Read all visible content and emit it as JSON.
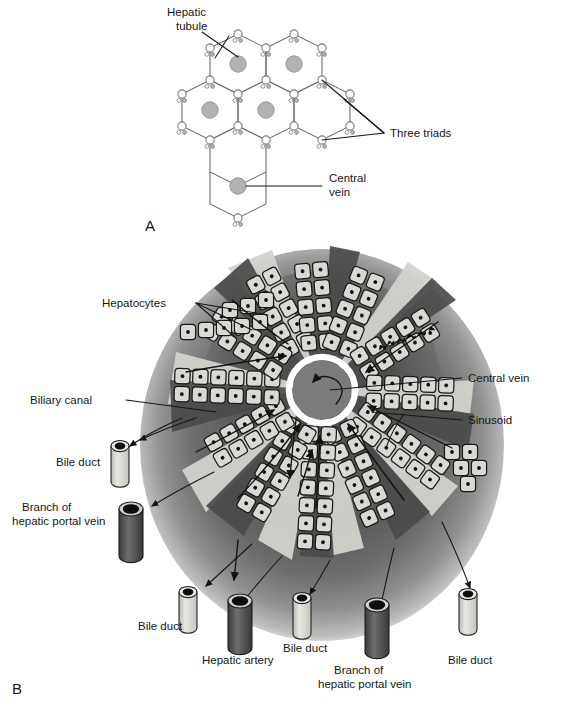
{
  "figure": {
    "panels": [
      {
        "id": "A",
        "letter": "A",
        "description": "Hexagonal arrangement of hepatic lobules showing triads and central veins",
        "labels": [
          {
            "key": "hepatic_tubule",
            "text_line1": "Hepatic",
            "text_line2": "tubule"
          },
          {
            "key": "three_triads",
            "text_line1": "Three triads",
            "text_line2": ""
          },
          {
            "key": "central_vein",
            "text_line1": "Central",
            "text_line2": "vein"
          }
        ],
        "counts": {
          "central_veins": 5,
          "triad_groups": 14,
          "triad_components_per_group": 3
        }
      },
      {
        "id": "B",
        "letter": "B",
        "description": "Cut-away of a single liver lobule with radiating plates of hepatocytes draining to the central vein",
        "signature": "Brand Christensen",
        "labels": [
          {
            "key": "hepatocytes",
            "text_line1": "Hepatocytes",
            "text_line2": ""
          },
          {
            "key": "biliary_canal",
            "text_line1": "Biliary canal",
            "text_line2": ""
          },
          {
            "key": "bile_duct_left_upper",
            "text_line1": "Bile duct",
            "text_line2": ""
          },
          {
            "key": "branch_hepatic_portal_vein_left",
            "text_line1": "Branch of",
            "text_line2": "hepatic portal vein"
          },
          {
            "key": "bile_duct_bottom_1",
            "text_line1": "Bile duct",
            "text_line2": ""
          },
          {
            "key": "hepatic_artery",
            "text_line1": "Hepatic artery",
            "text_line2": ""
          },
          {
            "key": "bile_duct_bottom_2",
            "text_line1": "Bile duct",
            "text_line2": ""
          },
          {
            "key": "branch_hepatic_portal_vein_bottom",
            "text_line1": "Branch of",
            "text_line2": "hepatic portal vein"
          },
          {
            "key": "bile_duct_bottom_3",
            "text_line1": "Bile duct",
            "text_line2": ""
          },
          {
            "key": "central_vein",
            "text_line1": "Central vein",
            "text_line2": ""
          },
          {
            "key": "sinusoid",
            "text_line1": "Sinusoid",
            "text_line2": ""
          }
        ],
        "vessels": [
          {
            "key": "bile_duct_left_upper",
            "type": "bile-duct",
            "tone": "light"
          },
          {
            "key": "branch_hepatic_portal_vein_left",
            "type": "portal-vein-branch",
            "tone": "dark"
          },
          {
            "key": "bile_duct_bottom_1",
            "type": "bile-duct",
            "tone": "light"
          },
          {
            "key": "hepatic_artery",
            "type": "hepatic-artery",
            "tone": "dark"
          },
          {
            "key": "bile_duct_bottom_2",
            "type": "bile-duct",
            "tone": "light"
          },
          {
            "key": "branch_hepatic_portal_vein_bottom",
            "type": "portal-vein-branch",
            "tone": "dark"
          },
          {
            "key": "bile_duct_bottom_3",
            "type": "bile-duct",
            "tone": "light"
          }
        ]
      }
    ]
  },
  "colors": {
    "background": "#ffffff",
    "cell_fill": "#d9d8d2",
    "nucleus": "#121212",
    "sinusoid_dark": "#4c4c4c",
    "lobule_edge": "#6d6d6d",
    "outline": "#191919",
    "triad_fill_gray": "#b4b4b4",
    "central_vein_ring": "#ffffff",
    "central_vein_fill": "#7a7a7a"
  }
}
